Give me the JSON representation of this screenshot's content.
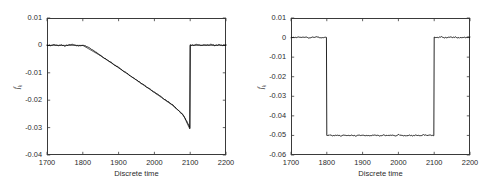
{
  "figure": {
    "panels": [
      {
        "id": "left",
        "xlabel": "Discrete time",
        "ylabel_base": "f",
        "ylabel_sub": "k",
        "xticks": [
          "1700",
          "1800",
          "1900",
          "2000",
          "2100",
          "2200"
        ],
        "yticks": [
          "0.01",
          "0",
          "-0.01",
          "-0.02",
          "-0.03",
          "-0.04"
        ]
      },
      {
        "id": "right",
        "xlabel": "Discrete time",
        "ylabel_base": "f",
        "ylabel_sub": "k",
        "xticks": [
          "1700",
          "1800",
          "1900",
          "2000",
          "2100",
          "2200"
        ],
        "yticks": [
          "0.01",
          "0",
          "-0.01",
          "-0.02",
          "-0.03",
          "-0.04",
          "-0.05",
          "-0.06"
        ]
      }
    ]
  },
  "chart_data": [
    {
      "type": "line",
      "id": "left-panel",
      "title": "",
      "xlabel": "Discrete time",
      "ylabel": "f_k",
      "xlim": [
        1700,
        2200
      ],
      "ylim": [
        -0.04,
        0.01
      ],
      "xticks": [
        1700,
        1800,
        1900,
        2000,
        2100,
        2200
      ],
      "yticks": [
        0.01,
        0,
        -0.01,
        -0.02,
        -0.03,
        -0.04
      ],
      "grid": false,
      "legend": null,
      "line_color": "#000000",
      "description": "Noisy signal flat near zero until k=1800, then a smooth knee into a linear negative ramp reaching about -0.0300 at k=2100, followed by an abrupt step back to zero and flat noisy behaviour until k=2200. A second, smoother estimate trace runs on top of the noisy trace and separates slightly near the end of the ramp, reaching about -0.0305.",
      "series": [
        {
          "name": "measured",
          "x": [
            1700,
            1710,
            1720,
            1730,
            1740,
            1750,
            1760,
            1770,
            1780,
            1790,
            1800,
            1810,
            1820,
            1830,
            1840,
            1850,
            1860,
            1870,
            1880,
            1890,
            1900,
            1910,
            1920,
            1930,
            1940,
            1950,
            1960,
            1970,
            1980,
            1990,
            2000,
            2010,
            2020,
            2030,
            2040,
            2050,
            2060,
            2070,
            2080,
            2090,
            2099,
            2100,
            2110,
            2120,
            2130,
            2140,
            2150,
            2160,
            2170,
            2180,
            2190,
            2200
          ],
          "y": [
            0.0002,
            -0.0001,
            0.0003,
            0.0,
            0.0002,
            -0.0002,
            0.0001,
            0.0003,
            0.0,
            -0.0001,
            0.0001,
            -0.0004,
            -0.0011,
            -0.0019,
            -0.0028,
            -0.0037,
            -0.0046,
            -0.0055,
            -0.0063,
            -0.0072,
            -0.0081,
            -0.009,
            -0.0099,
            -0.0108,
            -0.0117,
            -0.0126,
            -0.0135,
            -0.0144,
            -0.0153,
            -0.0162,
            -0.0171,
            -0.018,
            -0.0189,
            -0.0198,
            -0.0207,
            -0.0216,
            -0.0228,
            -0.0241,
            -0.0256,
            -0.0275,
            -0.03,
            0.0002,
            0.0001,
            0.0003,
            0.0,
            0.0002,
            0.0001,
            0.0003,
            -0.0001,
            0.0002,
            0.0,
            0.0002
          ]
        },
        {
          "name": "estimate",
          "x": [
            1700,
            1750,
            1800,
            1850,
            1900,
            1950,
            2000,
            2050,
            2080,
            2099,
            2100,
            2150,
            2200
          ],
          "y": [
            0.0,
            0.0,
            0.0,
            -0.0038,
            -0.0082,
            -0.0127,
            -0.0172,
            -0.0218,
            -0.0252,
            -0.0305,
            0.0,
            0.0,
            0.0
          ]
        }
      ]
    },
    {
      "type": "line",
      "id": "right-panel",
      "title": "",
      "xlabel": "Discrete time",
      "ylabel": "f_k",
      "xlim": [
        1700,
        2200
      ],
      "ylim": [
        -0.06,
        0.01
      ],
      "xticks": [
        1700,
        1800,
        1900,
        2000,
        2100,
        2200
      ],
      "yticks": [
        0.01,
        0,
        -0.01,
        -0.02,
        -0.03,
        -0.04,
        -0.05,
        -0.06
      ],
      "grid": false,
      "legend": null,
      "line_color": "#000000",
      "description": "Rectangular pulse: noisy signal at zero from k=1700 to k=1800, abrupt step down to about -0.050 held with small noise until k=2100, then abrupt step back to zero held until k=2200.",
      "series": [
        {
          "name": "measured",
          "x": [
            1700,
            1710,
            1720,
            1730,
            1740,
            1750,
            1760,
            1770,
            1780,
            1790,
            1799,
            1800,
            1810,
            1820,
            1830,
            1840,
            1850,
            1860,
            1870,
            1880,
            1890,
            1900,
            1910,
            1920,
            1930,
            1940,
            1950,
            1960,
            1970,
            1980,
            1990,
            2000,
            2010,
            2020,
            2030,
            2040,
            2050,
            2060,
            2070,
            2080,
            2090,
            2099,
            2100,
            2110,
            2120,
            2130,
            2140,
            2150,
            2160,
            2170,
            2180,
            2190,
            2200
          ],
          "y": [
            0.0002,
            -0.0001,
            0.0003,
            0.0,
            0.0002,
            -0.0002,
            0.0001,
            0.0004,
            0.0,
            -0.0001,
            0.0001,
            -0.05,
            -0.0498,
            -0.0502,
            -0.0499,
            -0.0503,
            -0.0497,
            -0.0501,
            -0.0499,
            -0.0502,
            -0.0498,
            -0.0501,
            -0.0499,
            -0.0503,
            -0.0497,
            -0.05,
            -0.0502,
            -0.0498,
            -0.0501,
            -0.0499,
            -0.0502,
            -0.0497,
            -0.05,
            -0.0503,
            -0.0498,
            -0.0501,
            -0.0499,
            -0.0502,
            -0.0497,
            -0.05,
            -0.0499,
            -0.0501,
            0.0002,
            0.0,
            0.0003,
            -0.0001,
            0.0002,
            0.0001,
            0.0003,
            -0.0002,
            0.0001,
            0.0,
            0.0002
          ]
        }
      ]
    }
  ]
}
